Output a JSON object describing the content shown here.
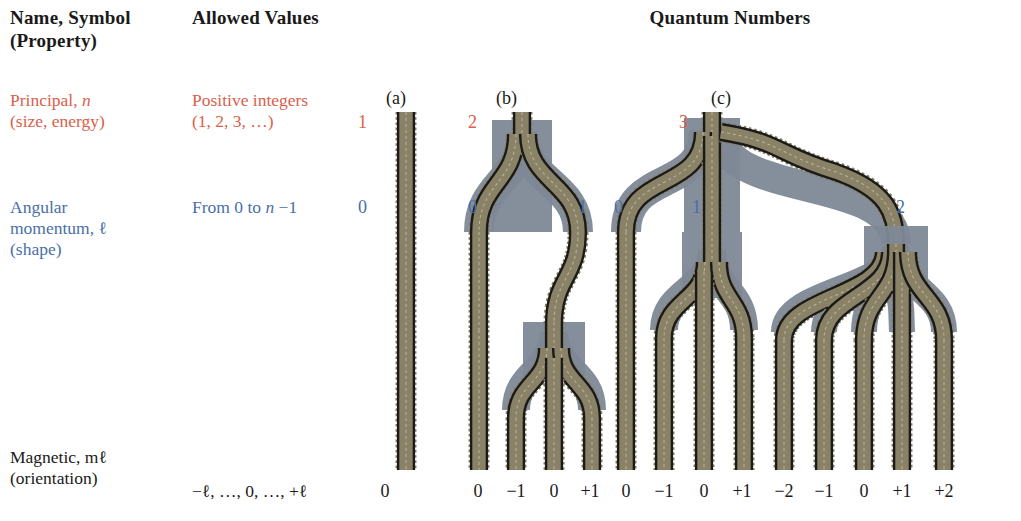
{
  "header": {
    "col1": "Name, Symbol\n(Property)",
    "col1_line1": "Name, Symbol",
    "col1_line2": "(Property)",
    "col2": "Allowed Values",
    "col3": "Quantum Numbers"
  },
  "rows": [
    {
      "key": "principal",
      "name_line1": "Principal, n",
      "name_line2": "(size, energy)",
      "values_line1": "Positive integers",
      "values_line2": "(1, 2, 3, …)",
      "color": "#d9604a"
    },
    {
      "key": "angular",
      "name_line1": "Angular",
      "name_line2": "momentum, ℓ",
      "name_line3": "(shape)",
      "values_line1": "From 0 to n −1",
      "color": "#4a6fa8"
    },
    {
      "key": "magnetic",
      "name_line1": "Magnetic, mℓ",
      "name_line2": "(orientation)",
      "values_line1": "−ℓ, …, 0, …, +ℓ",
      "color": "#1a1a1a"
    }
  ],
  "panels": [
    {
      "id": "a",
      "label": "(a)",
      "n": "1",
      "l": [
        "0"
      ],
      "ml": [
        "0"
      ]
    },
    {
      "id": "b",
      "label": "(b)",
      "n": "2",
      "l": [
        "0",
        "1"
      ],
      "ml": [
        "0",
        "−1",
        "0",
        "+1"
      ]
    },
    {
      "id": "c",
      "label": "(c)",
      "n": "3",
      "l": [
        "0",
        "1",
        "2"
      ],
      "ml": [
        "0",
        "−1",
        "0",
        "+1",
        "−2",
        "−1",
        "0",
        "+2_placeholder"
      ]
    }
  ],
  "diagram": {
    "panel_a": {
      "n_label": "1",
      "n_label_x": 358,
      "n_label_y": 113,
      "panel_label": "(a)",
      "panel_label_x": 386,
      "panel_label_y": 88,
      "l_labels": [
        {
          "text": "0",
          "x": 358,
          "y": 198
        }
      ],
      "ml_labels": [
        {
          "text": "0",
          "x": 385,
          "y": 481
        }
      ]
    },
    "panel_b": {
      "n_label": "2",
      "n_label_x": 468,
      "n_label_y": 113,
      "panel_label": "(b)",
      "panel_label_x": 496,
      "panel_label_y": 88,
      "l_labels": [
        {
          "text": "0",
          "x": 468,
          "y": 198
        },
        {
          "text": "1",
          "x": 578,
          "y": 198
        }
      ],
      "ml_labels": [
        {
          "text": "0",
          "x": 478,
          "y": 481
        },
        {
          "text": "−1",
          "x": 516,
          "y": 481
        },
        {
          "text": "0",
          "x": 554,
          "y": 481
        },
        {
          "text": "+1",
          "x": 590,
          "y": 481
        }
      ]
    },
    "panel_c": {
      "n_label": "3",
      "n_label_x": 679,
      "n_label_y": 113,
      "panel_label": "(c)",
      "panel_label_x": 711,
      "panel_label_y": 88,
      "l_labels": [
        {
          "text": "0",
          "x": 614,
          "y": 198
        },
        {
          "text": "1",
          "x": 692,
          "y": 198
        },
        {
          "text": "2",
          "x": 896,
          "y": 198
        }
      ],
      "ml_labels": [
        {
          "text": "0",
          "x": 626,
          "y": 481
        },
        {
          "text": "−1",
          "x": 664,
          "y": 481
        },
        {
          "text": "0",
          "x": 704,
          "y": 481
        },
        {
          "text": "+1",
          "x": 742,
          "y": 481
        },
        {
          "text": "−2",
          "x": 784,
          "y": 481
        },
        {
          "text": "−1",
          "x": 824,
          "y": 481
        },
        {
          "text": "0",
          "x": 864,
          "y": 481
        },
        {
          "text": "+1",
          "x": 902,
          "y": 481
        },
        {
          "text": "+2",
          "x": 944,
          "y": 481
        }
      ]
    },
    "colors": {
      "rail": "#1a1a1a",
      "tie": "#8a8266",
      "ballast": "#7e8896",
      "background": "#ffffff",
      "principal_red": "#d9604a",
      "angular_blue": "#4a6fa8",
      "text_black": "#1a1a1a"
    }
  }
}
